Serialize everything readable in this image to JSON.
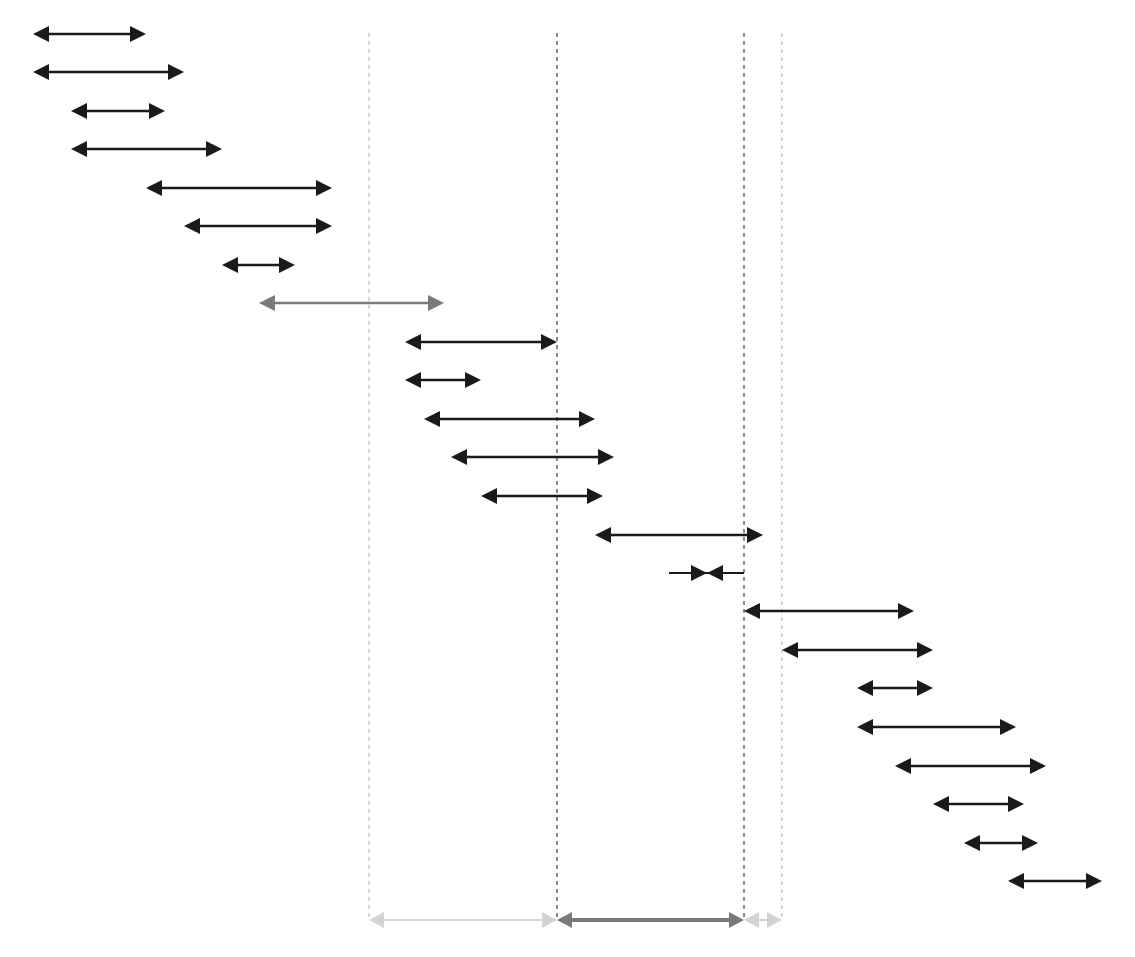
{
  "diagram": {
    "type": "interval-timeline",
    "width": 1135,
    "height": 957,
    "colors": {
      "dark": "#1a1a1a",
      "gray": "#7a7a7a",
      "light": "#d4d4d4",
      "guide_dark": "#8a8a8a",
      "guide_light": "#d8d8d8"
    },
    "guides": [
      {
        "x": 369,
        "y1": 33,
        "y2": 920,
        "tone": "light"
      },
      {
        "x": 557,
        "y1": 33,
        "y2": 920,
        "tone": "dark"
      },
      {
        "x": 744,
        "y1": 33,
        "y2": 920,
        "tone": "dark"
      },
      {
        "x": 782,
        "y1": 33,
        "y2": 920,
        "tone": "light"
      }
    ],
    "intervals": [
      {
        "y": 34,
        "x1": 33,
        "x2": 146,
        "tone": "dark",
        "style": "outward"
      },
      {
        "y": 72,
        "x1": 33,
        "x2": 184,
        "tone": "dark",
        "style": "outward"
      },
      {
        "y": 111,
        "x1": 71,
        "x2": 165,
        "tone": "dark",
        "style": "outward"
      },
      {
        "y": 149,
        "x1": 71,
        "x2": 222,
        "tone": "dark",
        "style": "outward"
      },
      {
        "y": 188,
        "x1": 146,
        "x2": 332,
        "tone": "dark",
        "style": "outward"
      },
      {
        "y": 226,
        "x1": 184,
        "x2": 332,
        "tone": "dark",
        "style": "outward"
      },
      {
        "y": 265,
        "x1": 222,
        "x2": 295,
        "tone": "dark",
        "style": "outward"
      },
      {
        "y": 303,
        "x1": 259,
        "x2": 444,
        "tone": "gray",
        "style": "outward"
      },
      {
        "y": 342,
        "x1": 405,
        "x2": 557,
        "tone": "dark",
        "style": "outward"
      },
      {
        "y": 380,
        "x1": 405,
        "x2": 481,
        "tone": "dark",
        "style": "outward"
      },
      {
        "y": 419,
        "x1": 424,
        "x2": 595,
        "tone": "dark",
        "style": "outward"
      },
      {
        "y": 457,
        "x1": 451,
        "x2": 614,
        "tone": "dark",
        "style": "outward"
      },
      {
        "y": 496,
        "x1": 481,
        "x2": 603,
        "tone": "dark",
        "style": "outward"
      },
      {
        "y": 535,
        "x1": 595,
        "x2": 763,
        "tone": "dark",
        "style": "outward"
      },
      {
        "y": 573,
        "x1": 669,
        "x2": 744,
        "tone": "dark",
        "style": "inward",
        "meet_x": 707
      },
      {
        "y": 611,
        "x1": 744,
        "x2": 914,
        "tone": "dark",
        "style": "outward"
      },
      {
        "y": 650,
        "x1": 782,
        "x2": 933,
        "tone": "dark",
        "style": "outward"
      },
      {
        "y": 688,
        "x1": 857,
        "x2": 933,
        "tone": "dark",
        "style": "outward"
      },
      {
        "y": 727,
        "x1": 857,
        "x2": 1016,
        "tone": "dark",
        "style": "outward"
      },
      {
        "y": 766,
        "x1": 895,
        "x2": 1046,
        "tone": "dark",
        "style": "outward"
      },
      {
        "y": 804,
        "x1": 933,
        "x2": 1024,
        "tone": "dark",
        "style": "outward"
      },
      {
        "y": 843,
        "x1": 964,
        "x2": 1038,
        "tone": "dark",
        "style": "outward"
      },
      {
        "y": 881,
        "x1": 1008,
        "x2": 1102,
        "tone": "dark",
        "style": "outward"
      }
    ],
    "summary_bar": [
      {
        "y": 920,
        "x1": 369,
        "x2": 557,
        "tone": "light",
        "thick": false
      },
      {
        "y": 920,
        "x1": 557,
        "x2": 744,
        "tone": "gray",
        "thick": true
      },
      {
        "y": 920,
        "x1": 744,
        "x2": 782,
        "tone": "light",
        "thick": false
      }
    ]
  }
}
